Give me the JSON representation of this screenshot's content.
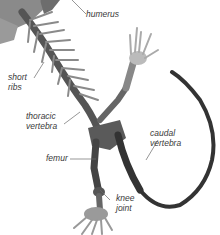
{
  "diagram": {
    "colors": {
      "bone_dark": "#3c3c3c",
      "bone_mid": "#7a7a7a",
      "bone_light": "#bdbdbd",
      "label_text": "#3a3a3a",
      "leader_line": "#6a6a6a",
      "background": "#ffffff"
    },
    "labels": [
      {
        "id": "humerus",
        "text": "humerus"
      },
      {
        "id": "short-ribs",
        "text": "short\nribs"
      },
      {
        "id": "thoracic-vertebra",
        "text": "thoracic\nvertebra"
      },
      {
        "id": "femur",
        "text": "femur"
      },
      {
        "id": "knee-joint",
        "text": "knee\njoint"
      },
      {
        "id": "caudal-vertebra",
        "text": "caudal\nvertebra"
      }
    ]
  }
}
